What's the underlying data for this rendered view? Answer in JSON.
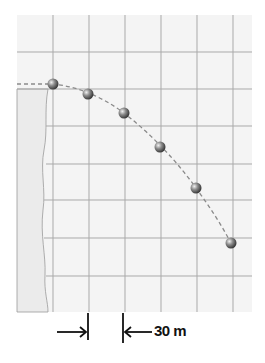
{
  "diagram": {
    "title": "",
    "grid": {
      "panel": {
        "x": 17,
        "y": 15,
        "width": 235,
        "height": 297,
        "fill": "#f4f4f4"
      },
      "vertical_lines_x": [
        53,
        89,
        125,
        161,
        197,
        233
      ],
      "horizontal_lines_y": [
        52,
        89,
        126,
        164,
        200,
        238,
        276
      ],
      "line_color": "#a9a9a9",
      "cell_size_label": "30 m"
    },
    "cliff": {
      "fill": "#ececec",
      "stroke": "#9a9a9a"
    },
    "trajectory": {
      "color": "#8a8a8a",
      "points": [
        {
          "x": 53,
          "y": 84
        },
        {
          "x": 88,
          "y": 94
        },
        {
          "x": 124,
          "y": 113
        },
        {
          "x": 160,
          "y": 147
        },
        {
          "x": 196,
          "y": 188
        },
        {
          "x": 231,
          "y": 243
        }
      ]
    },
    "ball_color": "#6e6e6e",
    "dimension": {
      "label": "30 m",
      "left_x": 88,
      "right_x": 123
    }
  }
}
